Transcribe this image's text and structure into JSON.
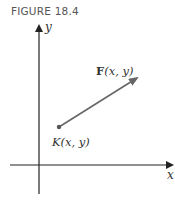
{
  "figure": {
    "caption": "FIGURE 18.4",
    "axes": {
      "x_label": "x",
      "y_label": "y"
    },
    "vector": {
      "label_bold": "F",
      "label_rest": "(x, y)",
      "color": "#666666"
    },
    "point": {
      "label": "K(x, y)",
      "color": "#555555"
    }
  }
}
